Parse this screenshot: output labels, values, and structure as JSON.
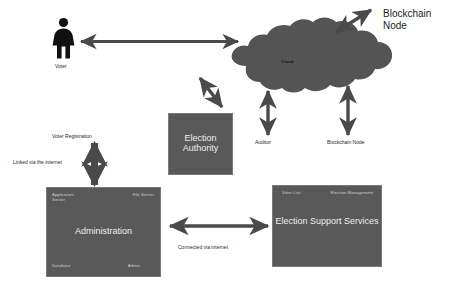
{
  "diagram": {
    "colors": {
      "box_fill": "#595959",
      "box_text": "#eeeeee",
      "cloud_fill": "#545454",
      "arrow": "#4a4a4a",
      "figure": "#111111",
      "label_text": "#2a2a2a",
      "background": "#ffffff"
    },
    "actors": {
      "voter": {
        "icon": "person-icon",
        "label": "Voter"
      }
    },
    "cloud": {
      "label": "Cloud"
    },
    "boxes": [
      {
        "id": "election-authority",
        "title": "Election\nAuthority",
        "title_size": "9px",
        "corners": []
      },
      {
        "id": "administration",
        "title": "Administration",
        "title_size": "9px",
        "corners": [
          {
            "pos": "top-left",
            "label": "Application\nServer"
          },
          {
            "pos": "top-right",
            "label": "File Server"
          },
          {
            "pos": "bottom-left",
            "label": "Database"
          },
          {
            "pos": "bottom-right",
            "label": "Admin"
          }
        ]
      },
      {
        "id": "election-support-services",
        "title": "Election Support Services",
        "title_size": "9px",
        "corners": [
          {
            "pos": "top-left",
            "label": "Voter List"
          },
          {
            "pos": "top-right",
            "label": "Election Management"
          }
        ]
      }
    ],
    "node_labels": {
      "blockchain_node_top": "Blockchain\nNode",
      "auditor": "Auditor",
      "blockchain_node_bottom": "Blockchain Node"
    },
    "connection_labels": {
      "voter_registration": "Voter Registration",
      "linked_via_internet": "Linked via the internet",
      "connected_via_internet": "Connected via internet"
    }
  }
}
